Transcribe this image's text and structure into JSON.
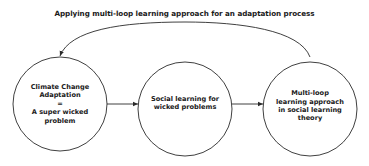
{
  "title": "Applying multi-loop learning approach for an adaptation process",
  "nodes": [
    {
      "id": "climate-change-adaptation",
      "lines": [
        "Climate Change",
        "Adaptation",
        "=",
        "A super wicked",
        "problem"
      ]
    },
    {
      "id": "social-learning",
      "lines": [
        "Social learning for",
        "wicked problems"
      ]
    },
    {
      "id": "multi-loop-learning",
      "lines": [
        "Multi-loop",
        "learning approach",
        "in social learning",
        "theory"
      ]
    }
  ],
  "edges": [
    {
      "from": "climate-change-adaptation",
      "to": "social-learning",
      "type": "arrow"
    },
    {
      "from": "social-learning",
      "to": "multi-loop-learning",
      "type": "arrow"
    },
    {
      "from": "multi-loop-learning",
      "to": "climate-change-adaptation",
      "type": "feedback-arc"
    }
  ],
  "colors": {
    "stroke": "#2a2a2a",
    "text": "#1a1a1a",
    "background": "#ffffff"
  }
}
